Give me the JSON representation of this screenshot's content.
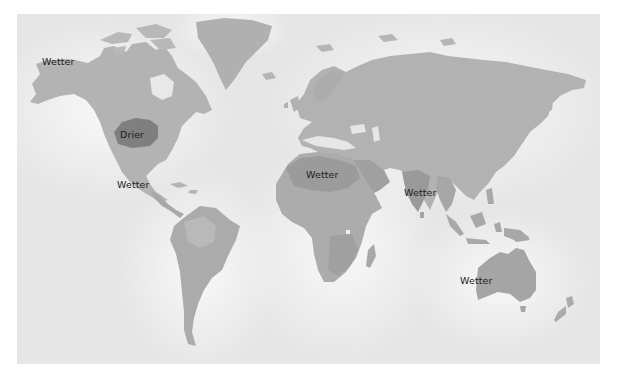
{
  "map": {
    "title_fragment": "",
    "colors": {
      "ocean": "#e9e9e9",
      "ocean_glow": "#f7f7f7",
      "land": "#b4b4b4",
      "land_mid": "#a6a6a6",
      "land_dark": "#999999",
      "drier_region": "#7e7e7e",
      "label_text": "#1b1b1b"
    },
    "labels": [
      {
        "id": "alaska",
        "text": "Wetter",
        "region": "Alaska",
        "x": 42,
        "y": 57
      },
      {
        "id": "us-midwest",
        "text": "Drier",
        "region": "Central United States",
        "x": 120,
        "y": 130
      },
      {
        "id": "central-america",
        "text": "Wetter",
        "region": "Mexico / Central America",
        "x": 117,
        "y": 180
      },
      {
        "id": "north-africa",
        "text": "Wetter",
        "region": "Sahara / North Africa",
        "x": 306,
        "y": 170
      },
      {
        "id": "india",
        "text": "Wetter",
        "region": "India",
        "x": 404,
        "y": 188
      },
      {
        "id": "australia",
        "text": "Wetter",
        "region": "Australia",
        "x": 460,
        "y": 276
      }
    ]
  }
}
